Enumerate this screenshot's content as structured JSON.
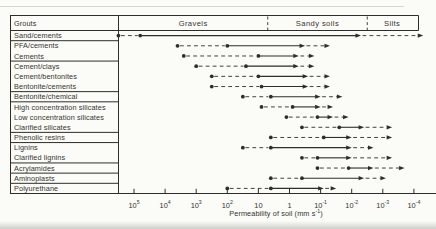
{
  "header": {
    "grouts_label": "Grouts",
    "soil_classes": [
      {
        "label": "Gravels",
        "from_exp": 5.5,
        "to_exp": 0.7
      },
      {
        "label": "Sandy soils",
        "from_exp": 0.7,
        "to_exp": -2.5
      },
      {
        "label": "Silts",
        "from_exp": -2.5,
        "to_exp": -4.1
      }
    ]
  },
  "axis": {
    "label_main": "Permeability of soil (mm s",
    "label_sup": "-1",
    "label_close": ")",
    "ticks": [
      {
        "exp": 5,
        "base": "10",
        "sup": "5"
      },
      {
        "exp": 4,
        "base": "10",
        "sup": "4"
      },
      {
        "exp": 3,
        "base": "10",
        "sup": "3"
      },
      {
        "exp": 2,
        "base": "10",
        "sup": "2"
      },
      {
        "exp": 1,
        "base": "10",
        "sup": ""
      },
      {
        "exp": 0,
        "base": "1",
        "sup": ""
      },
      {
        "exp": -1,
        "base": "10",
        "sup": "-1"
      },
      {
        "exp": -2,
        "base": "10",
        "sup": "-2"
      },
      {
        "exp": -3,
        "base": "10",
        "sup": "-3"
      },
      {
        "exp": -4,
        "base": "10",
        "sup": "-4"
      }
    ]
  },
  "chart_data": {
    "type": "range-bar",
    "x_scale": "log10",
    "x_unit": "mm s^-1",
    "x_range_exponents": [
      5,
      -4
    ],
    "group_sizes": [
      1,
      2,
      3,
      1,
      3,
      1,
      2,
      1,
      1,
      1
    ],
    "series": [
      {
        "label": "Sand/cements",
        "start_exp": 5.5,
        "main_start_exp": 4.8,
        "main_end_exp": -2.3,
        "extended_end_exp": -4.3
      },
      {
        "label": "PFA/cements",
        "start_exp": 3.6,
        "main_start_exp": 2.0,
        "main_end_exp": -0.5,
        "extended_end_exp": -1.3
      },
      {
        "label": "Cements",
        "start_exp": 3.4,
        "main_start_exp": 1.0,
        "main_end_exp": -0.3,
        "extended_end_exp": -0.8
      },
      {
        "label": "Cement/clays",
        "start_exp": 3.0,
        "main_start_exp": 1.4,
        "main_end_exp": -0.3,
        "extended_end_exp": -0.8
      },
      {
        "label": "Cement/bentonites",
        "start_exp": 2.5,
        "main_start_exp": 1.0,
        "main_end_exp": -0.6,
        "extended_end_exp": -1.3
      },
      {
        "label": "Bentonite/cements",
        "start_exp": 2.5,
        "main_start_exp": 0.9,
        "main_end_exp": -0.6,
        "extended_end_exp": -1.3
      },
      {
        "label": "Bentonite/chemical",
        "start_exp": 1.5,
        "main_start_exp": 0.6,
        "main_end_exp": -1.0,
        "extended_end_exp": -1.7
      },
      {
        "label": "High concentration silicates",
        "start_exp": 0.9,
        "main_start_exp": -0.1,
        "main_end_exp": -1.0,
        "extended_end_exp": -1.4
      },
      {
        "label": "Low concentration silicates",
        "start_exp": 0.1,
        "main_start_exp": -0.9,
        "main_end_exp": -1.4,
        "extended_end_exp": -1.9
      },
      {
        "label": "Clarified silicates",
        "start_exp": -0.4,
        "main_start_exp": -1.6,
        "main_end_exp": -2.4,
        "extended_end_exp": -3.3
      },
      {
        "label": "Phenolic resins",
        "start_exp": 0.6,
        "main_start_exp": -1.1,
        "main_end_exp": -2.0,
        "extended_end_exp": -3.3
      },
      {
        "label": "Lignins",
        "start_exp": 1.5,
        "main_start_exp": 0.6,
        "main_end_exp": -2.0,
        "extended_end_exp": -2.7
      },
      {
        "label": "Clarified lignins",
        "start_exp": -0.4,
        "main_start_exp": -0.9,
        "main_end_exp": -2.0,
        "extended_end_exp": -3.3
      },
      {
        "label": "Acrylamides",
        "start_exp": -0.9,
        "main_start_exp": -1.9,
        "main_end_exp": -2.7,
        "extended_end_exp": -3.7
      },
      {
        "label": "Aminoplasts",
        "start_exp": 0.6,
        "main_start_exp": -0.4,
        "main_end_exp": -2.4,
        "extended_end_exp": -3.1
      },
      {
        "label": "Polyurethane",
        "start_exp": 2.0,
        "main_start_exp": 0.6,
        "main_end_exp": -1.1,
        "extended_end_exp": -1.5
      }
    ]
  }
}
